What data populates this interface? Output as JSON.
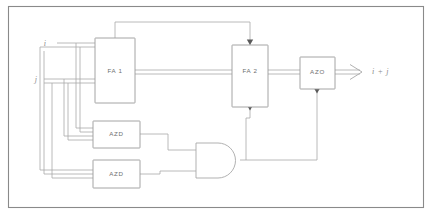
{
  "figure": {
    "type": "block-diagram",
    "border_color": "#8a8a8a",
    "wire_color": "#a8a8a8",
    "block_color": "#9a9a9a",
    "text_color": "#6e6e6e",
    "background": "#ffffff"
  },
  "blocks": [
    {
      "id": "fa1",
      "label": "FA 1"
    },
    {
      "id": "fa2",
      "label": "FA 2"
    },
    {
      "id": "azo",
      "label": "AZO"
    },
    {
      "id": "azd1",
      "label": "AZD"
    },
    {
      "id": "azd2",
      "label": "AZD"
    }
  ],
  "gates": [
    {
      "id": "and1",
      "label": "AND",
      "type": "and-gate"
    }
  ],
  "signals": {
    "input_i": "i",
    "input_j": "j",
    "output_sum": "i + j"
  }
}
